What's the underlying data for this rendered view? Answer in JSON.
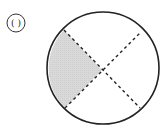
{
  "figure": {
    "label": "( )",
    "label_circle": {
      "cx": 16,
      "cy": 23,
      "r": 9
    },
    "circle": {
      "cx": 103,
      "cy": 68,
      "r": 56,
      "stroke": "#222222",
      "stroke_width": 1.6
    },
    "center_point": {
      "x": 102,
      "y": 70
    },
    "diagonals": [
      {
        "name": "upper-left-to-lower-right",
        "x1": 64,
        "y1": 30,
        "x2": 140,
        "y2": 108
      },
      {
        "name": "lower-left-to-upper-right",
        "x1": 65,
        "y1": 108,
        "x2": 141,
        "y2": 32
      }
    ],
    "shaded_region": {
      "name": "left-sector",
      "fill": "#d6d6d6",
      "vertices": [
        [
          64,
          30
        ],
        [
          102,
          70
        ],
        [
          65,
          108
        ]
      ]
    },
    "dash_color": "#222222",
    "dash_pattern": "3,3"
  }
}
